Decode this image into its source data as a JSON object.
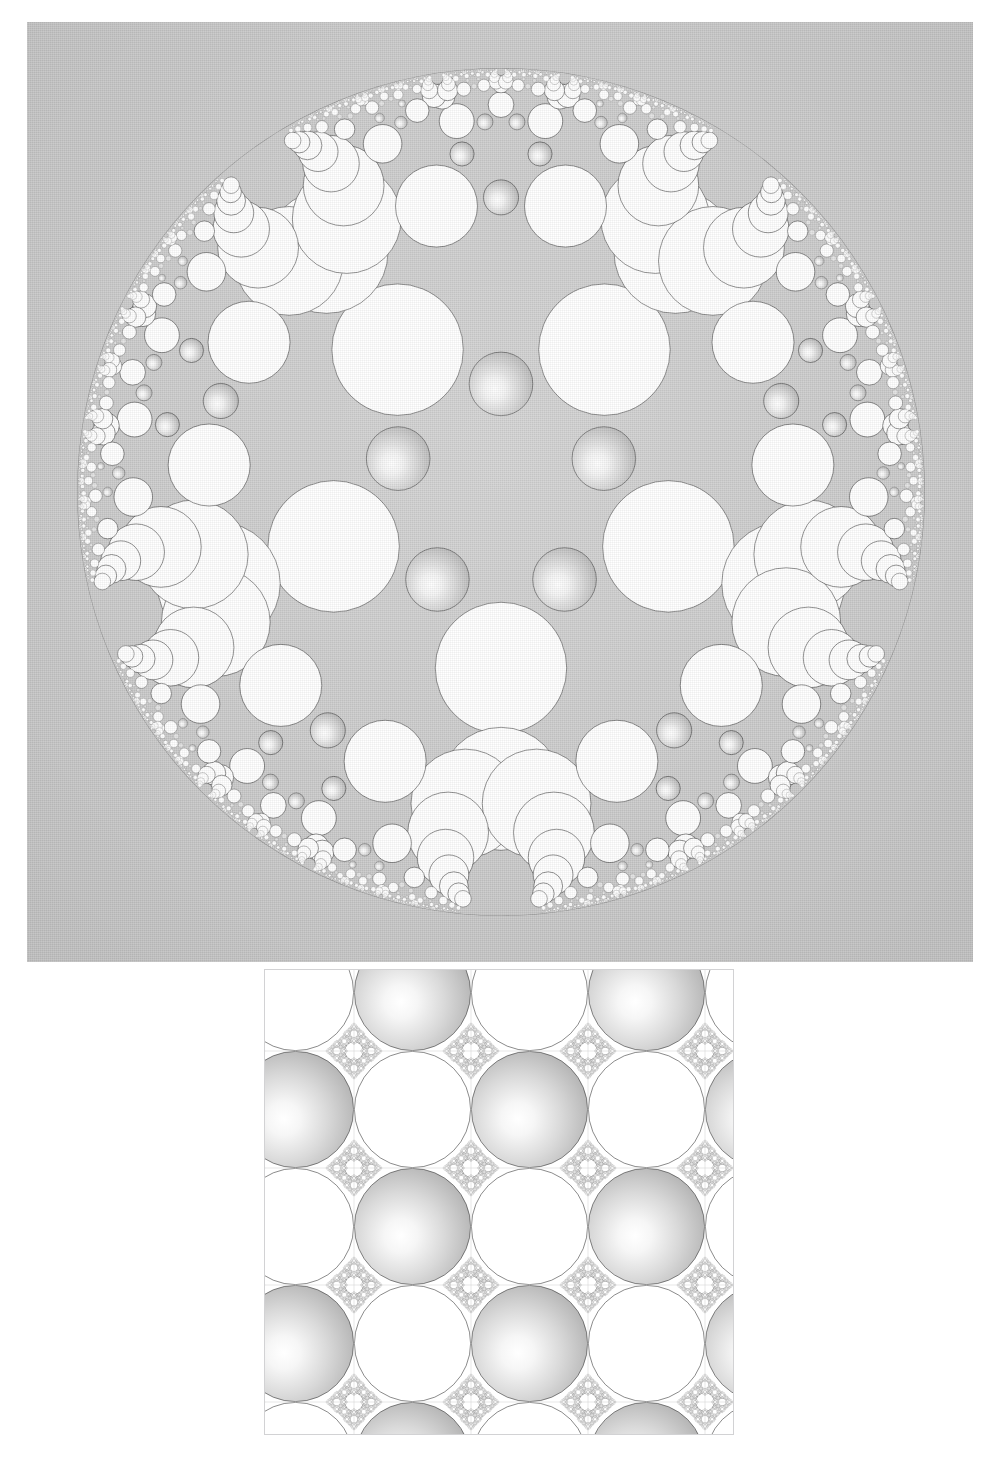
{
  "page": {
    "background_color": "#ffffff",
    "width": 1001,
    "height": 1467,
    "header_ghost_text": "· · · · ·"
  },
  "figure1": {
    "name": "apollonian-disk-packing",
    "caption": "",
    "frame": {
      "x": 27,
      "y": 22,
      "width": 946,
      "height": 940
    },
    "background_color": "#c9c9c9",
    "disk": {
      "cx": 474,
      "cy": 470,
      "r": 424
    },
    "symmetry_order": 5,
    "sphere_fill_light": "#ffffff",
    "sphere_fill_dark": "#9b9b9b",
    "flat_fill": "#ffffff",
    "limit_set_color": "#1b1b1b"
  },
  "figure2": {
    "name": "apollonian-lattice-packing",
    "caption": "",
    "frame": {
      "x": 264,
      "y": 969,
      "width": 470,
      "height": 466
    },
    "background_color": "#ffffff",
    "border_color": "#d2d2d4",
    "lattice_period": 117,
    "columns": 4,
    "rows": 4,
    "sphere_fill_light": "#ffffff",
    "sphere_fill_dark": "#9d9d9d",
    "flat_fill": "#ffffff",
    "limit_set_color": "#1b1b1b"
  },
  "chart_data": {
    "type": "diagram",
    "panels": [
      {
        "id": "top",
        "label": "Disk packing with 5-fold symmetry",
        "geometry": "poincare-disk",
        "outer_radius": 424,
        "symmetry": 5,
        "generation_depth": 7,
        "shaded_circles": 5,
        "white_circles": 5,
        "cluster_centers": 6
      },
      {
        "id": "bottom",
        "label": "Doubly-periodic square-lattice packing",
        "geometry": "euclidean-lattice",
        "lattice_period_px": 117,
        "tiles_x": 4,
        "tiles_y": 4,
        "generation_depth": 6,
        "checker_pattern": "alternating shaded / white"
      }
    ]
  }
}
